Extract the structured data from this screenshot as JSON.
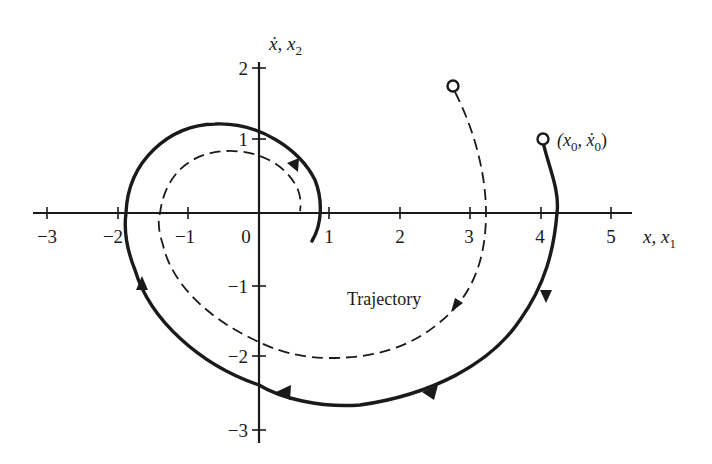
{
  "figure": {
    "type": "phase-plane",
    "x_axis": {
      "label": "x, x",
      "label_sub": "1",
      "ticks": [
        "−3",
        "−2",
        "−1",
        "0",
        "1",
        "2",
        "3",
        "4",
        "5"
      ],
      "tick_values": [
        -3,
        -2,
        -1,
        0,
        1,
        2,
        3,
        4,
        5
      ]
    },
    "y_axis": {
      "label": "ẋ, x",
      "label_sub": "2",
      "ticks": [
        "2",
        "1",
        "−1",
        "−2",
        "−3"
      ],
      "tick_values": [
        2,
        1,
        -1,
        -2,
        -3
      ]
    },
    "initial_point_label": "(x",
    "initial_point_sub": "0",
    "initial_point_mid": ", ẋ",
    "initial_point_sub2": "0",
    "initial_point_close": ")",
    "trajectory_label": "Trajectory",
    "colors": {
      "ink": "#1a1a1a",
      "background": "#ffffff"
    },
    "curves": [
      {
        "name": "solid-trajectory",
        "style": "solid",
        "start": [
          4.0,
          1.0
        ],
        "points": [
          [
            4.0,
            1.0
          ],
          [
            4.18,
            0.0
          ],
          [
            4.0,
            -0.8
          ],
          [
            3.5,
            -1.9
          ],
          [
            2.4,
            -2.5
          ],
          [
            1.4,
            -2.65
          ],
          [
            0.4,
            -2.55
          ],
          [
            0.0,
            -2.4
          ],
          [
            -1.1,
            -1.7
          ],
          [
            -1.65,
            -0.8
          ],
          [
            -1.88,
            0.0
          ],
          [
            -1.65,
            0.85
          ],
          [
            -0.6,
            1.25
          ],
          [
            0.2,
            1.1
          ],
          [
            0.75,
            0.5
          ],
          [
            0.87,
            0.0
          ],
          [
            0.75,
            -0.4
          ]
        ]
      },
      {
        "name": "dashed-trajectory",
        "style": "dashed",
        "start": [
          2.75,
          1.75
        ],
        "points": [
          [
            2.75,
            1.75
          ],
          [
            3.1,
            0.9
          ],
          [
            3.2,
            0.0
          ],
          [
            2.95,
            -0.9
          ],
          [
            2.3,
            -1.6
          ],
          [
            1.2,
            -2.0
          ],
          [
            0.3,
            -1.95
          ],
          [
            0.0,
            -1.8
          ],
          [
            -0.8,
            -1.35
          ],
          [
            -1.3,
            -0.5
          ],
          [
            -1.42,
            0.0
          ],
          [
            -1.25,
            0.55
          ],
          [
            -0.4,
            0.86
          ],
          [
            0.2,
            0.72
          ],
          [
            0.52,
            0.4
          ],
          [
            0.58,
            0.03
          ]
        ]
      }
    ]
  }
}
